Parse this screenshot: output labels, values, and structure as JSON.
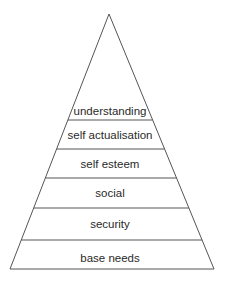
{
  "diagram": {
    "type": "pyramid",
    "colors": {
      "stroke": "#555555",
      "text": "#2a2a2a",
      "background": "#ffffff"
    },
    "levels": [
      {
        "label": "understanding"
      },
      {
        "label": "self actualisation"
      },
      {
        "label": "self esteem"
      },
      {
        "label": "social"
      },
      {
        "label": "security"
      },
      {
        "label": "base needs"
      }
    ]
  }
}
